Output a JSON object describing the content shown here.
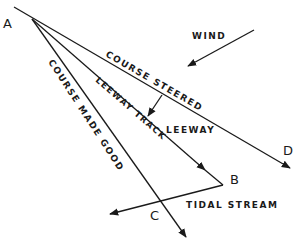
{
  "diagram": {
    "points": {
      "A": "A",
      "B": "B",
      "C": "C",
      "D": "D"
    },
    "labels": {
      "wind": "WIND",
      "course_steered": "COURSE STEERED",
      "leeway_track": "LEEWAY TRACK",
      "leeway": "LEEWAY",
      "course_made_good": "COURSE MADE GOOD",
      "tidal_stream": "TIDAL STREAM"
    },
    "colors": {
      "ink": "#1a1a1a",
      "background": "#ffffff"
    }
  }
}
